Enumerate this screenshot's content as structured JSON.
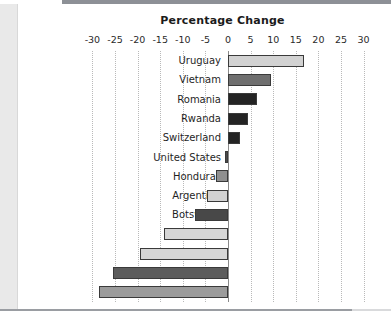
{
  "chart_data": {
    "type": "bar",
    "orientation": "horizontal",
    "title": "Percentage Change",
    "xlabel": "",
    "ylabel": "",
    "xlim": [
      -30,
      30
    ],
    "xticks": [
      -30,
      -25,
      -20,
      -15,
      -10,
      -5,
      0,
      5,
      10,
      15,
      20,
      25,
      30
    ],
    "xtick_labels": [
      "-30",
      "-25",
      "-20",
      "-15",
      "-10",
      "-5",
      "0",
      "5",
      "10",
      "15",
      "20",
      "25",
      "30"
    ],
    "grid": true,
    "grid_style": "dotted-vertical",
    "legend": null,
    "categories": [
      "Uruguay",
      "Vietnam",
      "Romania",
      "Rwanda",
      "Switzerland",
      "United States",
      "Honduras",
      "Argentina",
      "Botswana",
      "Benin",
      "Gambia",
      "Cambodia",
      "Ivory Coast"
    ],
    "values": [
      16.8,
      9.6,
      6.4,
      4.4,
      2.6,
      -0.6,
      -2.6,
      -4.6,
      -7.2,
      -14.2,
      -19.4,
      -25.4,
      -28.6
    ],
    "bar_colors": [
      "#d2d2d2",
      "#6f6f6f",
      "#242424",
      "#242424",
      "#242424",
      "#4a4a4a",
      "#8f8f8f",
      "#d2d2d2",
      "#484848",
      "#d6d6d6",
      "#d6d6d6",
      "#5c5c5c",
      "#9b9b9b"
    ],
    "bar_edge_color": "#3a3a3a"
  },
  "style": {
    "background": "#ffffff",
    "panel_background": "#ffffff",
    "gutter": "#e9e9e9",
    "rule": "#9a9da2",
    "grid_color": "#b9b9b9",
    "axis_color": "#8a8a8a",
    "text_color": "#1f1f1f"
  }
}
